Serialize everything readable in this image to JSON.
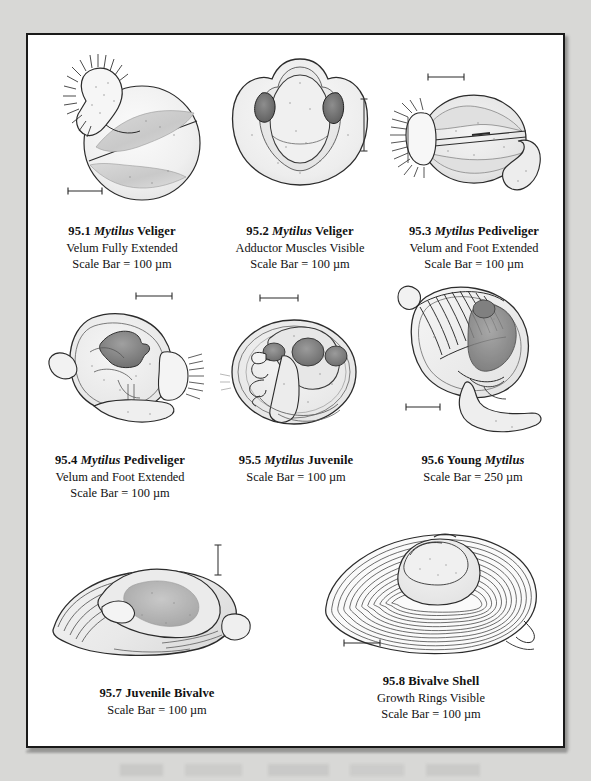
{
  "plate": {
    "number": "95",
    "background": "#ffffff",
    "border_color": "#1a1a1a",
    "page_background": "#d8d8d6"
  },
  "figures": [
    {
      "id": "95.1",
      "number": "95.1",
      "taxon": "Mytilus",
      "stage": "Veliger",
      "title_prefix": "95.1 ",
      "title_suffix": " Veliger",
      "subtitle": "Velum Fully Extended",
      "scale": "Scale Bar = 100 µm",
      "scale_value": 100,
      "scale_unit": "µm",
      "scale_bar_orientation": "horizontal",
      "art_name": "mytilus-veliger-velum-extended"
    },
    {
      "id": "95.2",
      "number": "95.2",
      "taxon": "Mytilus",
      "stage": "Veliger",
      "title_prefix": "95.2 ",
      "title_suffix": " Veliger",
      "subtitle": "Adductor Muscles Visible",
      "scale": "Scale Bar = 100 µm",
      "scale_value": 100,
      "scale_unit": "µm",
      "scale_bar_orientation": "vertical",
      "art_name": "mytilus-veliger-adductor-muscles"
    },
    {
      "id": "95.3",
      "number": "95.3",
      "taxon": "Mytilus",
      "stage": "Pediveliger",
      "title_prefix": "95.3 ",
      "title_suffix": " Pediveliger",
      "subtitle": "Velum and Foot Extended",
      "scale": "Scale Bar = 100 µm",
      "scale_value": 100,
      "scale_unit": "µm",
      "scale_bar_orientation": "horizontal",
      "art_name": "mytilus-pediveliger-velum-foot"
    },
    {
      "id": "95.4",
      "number": "95.4",
      "taxon": "Mytilus",
      "stage": "Pediveliger",
      "title_prefix": "95.4 ",
      "title_suffix": " Pediveliger",
      "subtitle": "Velum and Foot Extended",
      "scale": "Scale Bar = 100 µm",
      "scale_value": 100,
      "scale_unit": "µm",
      "scale_bar_orientation": "horizontal",
      "art_name": "mytilus-pediveliger-lateral"
    },
    {
      "id": "95.5",
      "number": "95.5",
      "taxon": "Mytilus",
      "stage": "Juvenile",
      "title_prefix": "95.5 ",
      "title_suffix": " Juvenile",
      "subtitle": "",
      "scale": "Scale Bar = 100 µm",
      "scale_value": 100,
      "scale_unit": "µm",
      "scale_bar_orientation": "horizontal",
      "art_name": "mytilus-juvenile"
    },
    {
      "id": "95.6",
      "number": "95.6 Young ",
      "taxon": "Mytilus",
      "stage": "",
      "title_prefix": "95.6 Young ",
      "title_suffix": "",
      "subtitle": "",
      "scale": "Scale Bar = 250 µm",
      "scale_value": 250,
      "scale_unit": "µm",
      "scale_bar_orientation": "horizontal",
      "art_name": "young-mytilus-gills-foot"
    },
    {
      "id": "95.7",
      "number": "95.7",
      "taxon": "",
      "stage": "Juvenile Bivalve",
      "title_prefix": "95.7 Juvenile Bivalve",
      "title_suffix": "",
      "subtitle": "",
      "scale": "Scale Bar = 100 µm",
      "scale_value": 100,
      "scale_unit": "µm",
      "scale_bar_orientation": "vertical",
      "art_name": "juvenile-bivalve-shell"
    },
    {
      "id": "95.8",
      "number": "95.8",
      "taxon": "",
      "stage": "Bivalve Shell",
      "title_prefix": "95.8 Bivalve Shell",
      "title_suffix": "",
      "subtitle": "Growth Rings Visible",
      "scale": "Scale Bar = 100 µm",
      "scale_value": 100,
      "scale_unit": "µm",
      "scale_bar_orientation": "horizontal",
      "art_name": "bivalve-shell-growth-rings"
    }
  ]
}
